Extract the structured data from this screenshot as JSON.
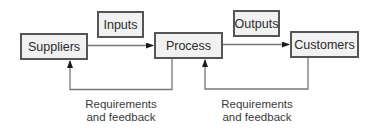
{
  "diagram": {
    "title": "",
    "nodes": [
      {
        "id": "suppliers",
        "label": "Suppliers"
      },
      {
        "id": "process",
        "label": "Process"
      },
      {
        "id": "customers",
        "label": "Customers"
      }
    ],
    "flow_labels": {
      "inputs": "Inputs",
      "outputs": "Outputs"
    },
    "feedback_labels": [
      {
        "line1": "Requirements",
        "line2": "and feedback"
      },
      {
        "line1": "Requirements",
        "line2": "and feedback"
      }
    ],
    "edges": [
      {
        "from": "suppliers",
        "to": "process",
        "label": "Inputs"
      },
      {
        "from": "process",
        "to": "customers",
        "label": "Outputs"
      },
      {
        "from": "process",
        "to": "suppliers",
        "label": "Requirements and feedback"
      },
      {
        "from": "customers",
        "to": "process",
        "label": "Requirements and feedback"
      }
    ],
    "colors": {
      "line": "#777777",
      "box_border": "#555555",
      "box_fill": "#f1f1f1"
    }
  }
}
